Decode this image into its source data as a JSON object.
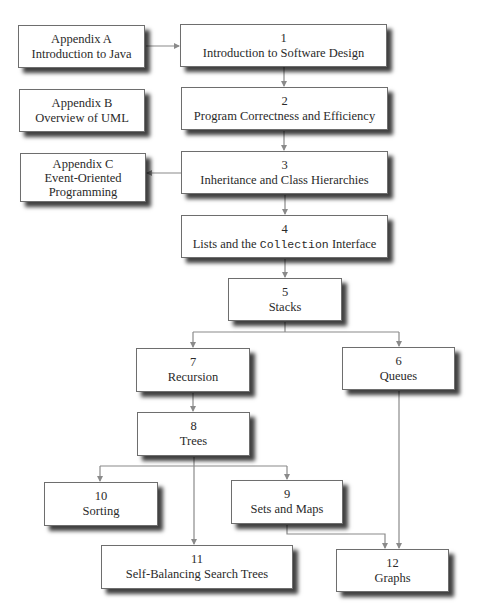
{
  "diagram": {
    "type": "chapter-dependency-flowchart",
    "colors": {
      "box_border": "#6e6e6e",
      "box_fill": "#ffffff",
      "edge": "#8a8a8a",
      "text": "#2a2a2a"
    },
    "nodes": [
      {
        "id": "appA",
        "line1": "Appendix A",
        "line2": "Introduction to Java"
      },
      {
        "id": "appB",
        "line1": "Appendix B",
        "line2": "Overview of UML"
      },
      {
        "id": "appC",
        "line1": "Appendix C",
        "line2": "Event-Oriented",
        "line3": "Programming"
      },
      {
        "id": "ch1",
        "num": "1",
        "title": "Introduction to Software Design"
      },
      {
        "id": "ch2",
        "num": "2",
        "title": "Program Correctness and Efficiency"
      },
      {
        "id": "ch3",
        "num": "3",
        "title": "Inheritance and Class Hierarchies"
      },
      {
        "id": "ch4",
        "num": "4",
        "title_pre": "Lists and the ",
        "title_code": "Collection",
        "title_post": " Interface"
      },
      {
        "id": "ch5",
        "num": "5",
        "title": "Stacks"
      },
      {
        "id": "ch6",
        "num": "6",
        "title": "Queues"
      },
      {
        "id": "ch7",
        "num": "7",
        "title": "Recursion"
      },
      {
        "id": "ch8",
        "num": "8",
        "title": "Trees"
      },
      {
        "id": "ch9",
        "num": "9",
        "title": "Sets and Maps"
      },
      {
        "id": "ch10",
        "num": "10",
        "title": "Sorting"
      },
      {
        "id": "ch11",
        "num": "11",
        "title": "Self-Balancing Search Trees"
      },
      {
        "id": "ch12",
        "num": "12",
        "title": "Graphs"
      }
    ],
    "edges": [
      {
        "from": "appA",
        "to": "ch1"
      },
      {
        "from": "ch1",
        "to": "ch2"
      },
      {
        "from": "ch2",
        "to": "ch3"
      },
      {
        "from": "ch3",
        "to": "appC"
      },
      {
        "from": "ch3",
        "to": "ch4"
      },
      {
        "from": "ch4",
        "to": "ch5"
      },
      {
        "from": "ch5",
        "to": "ch7"
      },
      {
        "from": "ch5",
        "to": "ch6"
      },
      {
        "from": "ch7",
        "to": "ch8"
      },
      {
        "from": "ch8",
        "to": "ch10"
      },
      {
        "from": "ch8",
        "to": "ch9"
      },
      {
        "from": "ch8",
        "to": "ch11"
      },
      {
        "from": "ch9",
        "to": "ch12"
      },
      {
        "from": "ch6",
        "to": "ch12"
      }
    ]
  }
}
